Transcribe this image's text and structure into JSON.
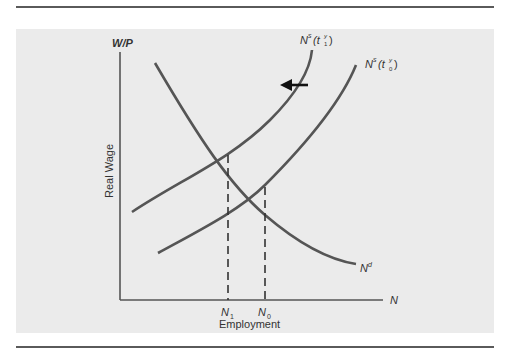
{
  "diagram": {
    "type": "labor market supply-demand",
    "y_axis_label": "W/P",
    "y_axis_title": "Real Wage",
    "x_axis_label": "N",
    "x_axis_title": "Employment",
    "x_ticks": [
      {
        "base": "N",
        "sub": "1"
      },
      {
        "base": "N",
        "sub": "0"
      }
    ],
    "curves": [
      {
        "id": "demand",
        "label_base": "N",
        "label_sup": "d"
      },
      {
        "id": "supply_1",
        "label_base": "N",
        "label_sup": "s",
        "label_arg": "(t",
        "label_arg_sup": "y",
        "label_arg_sub": "1",
        "label_close": ")"
      },
      {
        "id": "supply_0",
        "label_base": "N",
        "label_sup": "s",
        "label_arg": "(t",
        "label_arg_sup": "y",
        "label_arg_sub": "0",
        "label_close": ")"
      }
    ],
    "shift_arrow": "left",
    "colors": {
      "curve": "#555555",
      "panel": "#ebebeb",
      "rule": "#5a5a5a"
    }
  }
}
